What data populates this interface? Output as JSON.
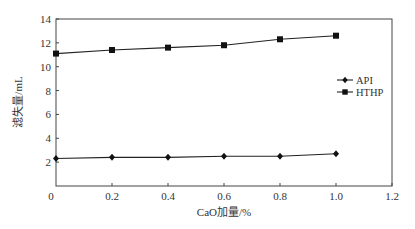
{
  "chart_data": {
    "type": "line",
    "title": "",
    "xlabel": "CaO加量/%",
    "ylabel": "滤失量/mL",
    "xlim": [
      0,
      1.2
    ],
    "ylim": [
      0,
      14
    ],
    "xticks": [
      0,
      0.2,
      0.4,
      0.6,
      0.8,
      1.0,
      1.2
    ],
    "xtick_labels": [
      "0",
      "0.2",
      "0.4",
      "0.6",
      "0.8",
      "1.0",
      "1.2"
    ],
    "yticks": [
      2,
      4,
      6,
      8,
      10,
      12,
      14
    ],
    "ytick_labels": [
      "2",
      "4",
      "6",
      "8",
      "10",
      "12",
      "14"
    ],
    "grid": false,
    "legend_position": "right-middle",
    "x": [
      0,
      0.2,
      0.4,
      0.6,
      0.8,
      1.0
    ],
    "series": [
      {
        "name": "API",
        "marker": "diamond",
        "color": "#222222",
        "values": [
          2.3,
          2.4,
          2.4,
          2.5,
          2.5,
          2.7
        ]
      },
      {
        "name": "HTHP",
        "marker": "square",
        "color": "#222222",
        "values": [
          11.1,
          11.4,
          11.6,
          11.8,
          12.3,
          12.6
        ]
      }
    ]
  }
}
